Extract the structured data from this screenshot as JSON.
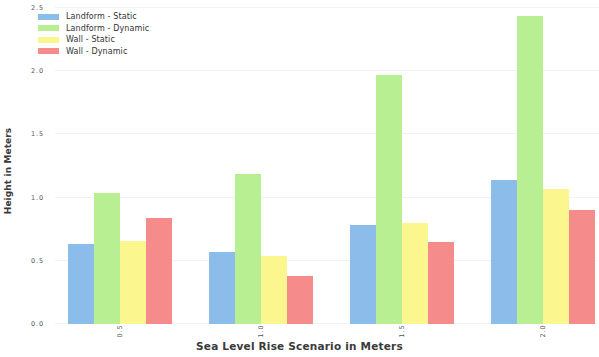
{
  "chart_data": {
    "type": "bar",
    "title": "",
    "xlabel": "Sea Level Rise Scenario in Meters",
    "ylabel": "Height in Meters",
    "categories": [
      "0.5",
      "1.0",
      "1.5",
      "2.0"
    ],
    "series": [
      {
        "name": "Landform - Static",
        "color": "#8cbcea",
        "values": [
          0.63,
          0.57,
          0.78,
          1.14
        ]
      },
      {
        "name": "Landform - Dynamic",
        "color": "#b8ef92",
        "values": [
          1.04,
          1.19,
          1.97,
          2.44
        ]
      },
      {
        "name": "Wall - Static",
        "color": "#fbf68e",
        "values": [
          0.66,
          0.54,
          0.8,
          1.07
        ]
      },
      {
        "name": "Wall - Dynamic",
        "color": "#f68b8b",
        "values": [
          0.84,
          0.38,
          0.65,
          0.9
        ]
      }
    ],
    "ylim": [
      0.0,
      2.5
    ],
    "yticks": [
      "0.0",
      "0.5",
      "1.0",
      "1.5",
      "2.0",
      "2.5"
    ],
    "ytick_values": [
      0.0,
      0.5,
      1.0,
      1.5,
      2.0,
      2.5
    ],
    "grid": true,
    "legend_position": "upper left",
    "xtick_rotation": -90
  }
}
